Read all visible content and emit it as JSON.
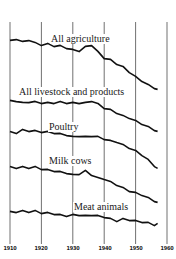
{
  "chart_data": {
    "type": "line",
    "title": "",
    "xlabel": "",
    "ylabel": "",
    "x_ticks": [
      1910,
      1920,
      1930,
      1940,
      1950,
      1960
    ],
    "xlim": [
      1910,
      1960
    ],
    "grid": {
      "vertical": true,
      "horizontal": false
    },
    "legend": "inline labels",
    "x": [
      1910,
      1912,
      1914,
      1916,
      1918,
      1920,
      1922,
      1924,
      1926,
      1928,
      1930,
      1932,
      1934,
      1936,
      1938,
      1940,
      1942,
      1944,
      1946,
      1948,
      1950,
      1952,
      1954,
      1956,
      1957
    ],
    "series": [
      {
        "name": "All agriculture",
        "label_pos": [
          1924,
          1932
        ],
        "y_px": [
          41,
          39,
          42,
          40,
          43,
          45,
          44,
          46,
          46,
          48,
          50,
          51,
          47,
          45,
          52,
          58,
          60,
          64,
          67,
          72,
          77,
          81,
          85,
          88,
          90
        ]
      },
      {
        "name": "All livestock and products",
        "label_pos": [
          1912,
          1940
        ],
        "y_px": [
          101,
          101,
          103,
          102,
          102,
          103,
          103,
          103,
          102,
          103,
          103,
          103,
          103,
          101,
          104,
          108,
          110,
          113,
          116,
          118,
          121,
          124,
          127,
          130,
          132
        ]
      },
      {
        "name": "Poultry",
        "label_pos": [
          1923,
          1933
        ],
        "y_px": [
          132,
          133,
          130,
          131,
          131,
          132,
          132,
          133,
          134,
          135,
          137,
          136,
          137,
          136,
          137,
          139,
          141,
          142,
          145,
          148,
          151,
          155,
          160,
          166,
          169
        ]
      },
      {
        "name": "Milk cows",
        "label_pos": [
          1921,
          1931
        ],
        "y_px": [
          167,
          168,
          167,
          168,
          167,
          169,
          170,
          171,
          172,
          173,
          175,
          174,
          171,
          175,
          178,
          179,
          182,
          185,
          188,
          191,
          193,
          195,
          198,
          201,
          203
        ]
      },
      {
        "name": "Meat animals",
        "label_pos": [
          1930,
          1948
        ],
        "y_px": [
          212,
          212,
          211,
          212,
          211,
          213,
          213,
          214,
          215,
          216,
          215,
          215,
          216,
          215,
          216,
          217,
          219,
          221,
          219,
          220,
          221,
          222,
          223,
          225,
          224
        ]
      }
    ]
  },
  "labels": {
    "all_agriculture": "All agriculture",
    "all_livestock": "All livestock and products",
    "poultry": "Poultry",
    "milk_cows": "Milk cows",
    "meat_animals": "Meat animals"
  },
  "ticks": [
    "1910",
    "1920",
    "1930",
    "1940",
    "1950",
    "1960"
  ],
  "colors": {
    "line": "#111111",
    "grid": "#333333",
    "background": "#ffffff"
  }
}
